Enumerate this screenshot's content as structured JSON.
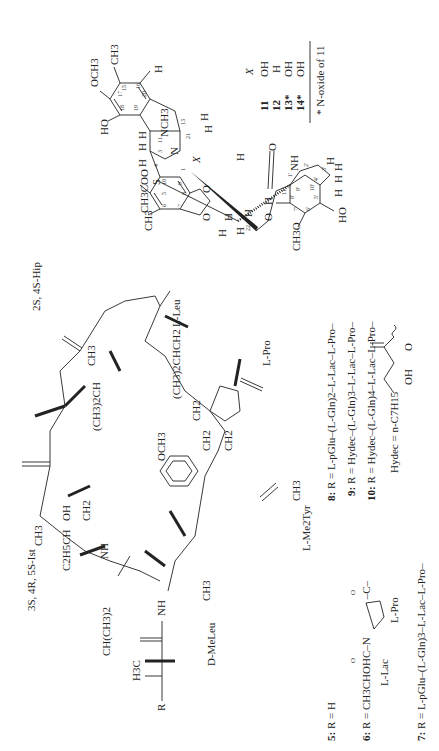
{
  "document": {
    "orientation": "rotated-90-ccw",
    "ecteinascidin": {
      "atoms": {
        "och3_top": "OCH3",
        "ch3_16": "CH3",
        "ho_18": "HO",
        "nch3": "NCH3",
        "s": "S",
        "n2": "N",
        "x_sub": "X",
        "ch3coo": "CH3COO",
        "ch3_6": "CH3",
        "o_a": "O",
        "o_b": "O",
        "o_22": "O",
        "o_carbonyl": "O",
        "nh_2p": "NH",
        "ch3o_7p": "CH3O",
        "ho_6p": "HO",
        "h": "H"
      },
      "ring_numbers": [
        "1",
        "2",
        "3",
        "4",
        "5",
        "6",
        "7",
        "8",
        "9",
        "10",
        "11",
        "12",
        "13",
        "14",
        "15",
        "16",
        "17",
        "18",
        "19",
        "20",
        "21",
        "22"
      ],
      "prime_numbers": [
        "1'",
        "2'",
        "3'",
        "4'",
        "5'",
        "6'",
        "7'",
        "8'",
        "9'",
        "10'",
        "11'",
        "12'"
      ],
      "table": {
        "header": [
          "",
          "X"
        ],
        "rows": [
          {
            "compound": "11",
            "x": "OH"
          },
          {
            "compound": "12",
            "x": "H"
          },
          {
            "compound": "13*",
            "x": "OH"
          },
          {
            "compound": "14*",
            "x": "OH"
          }
        ],
        "footnote": "* N-oxide of 11"
      }
    },
    "didemnin": {
      "residue_labels": {
        "hip": "2S, 4S-Hip",
        "leu": "L-Leu",
        "pro": "L-Pro",
        "ist": "3S, 4R, 5S-Ist",
        "meleu": "D-MeLeu",
        "tyr": "L-Me2Tyr"
      },
      "groups": {
        "ch3_hip": "CH3",
        "ipr_hip": "(CH3)2CH",
        "ibu_leu": "(CH3)2CHCH2",
        "ch2": "CH2",
        "och3_tyr": "OCH3",
        "ch3_n": "CH3",
        "oh_ist": "OH",
        "ch3_ist": "CH3",
        "et_ist": "C2H5CH",
        "nh": "NH",
        "ch3_lac": "CH3",
        "chme2": "CH(CH3)2",
        "h3c": "H3C",
        "r": "R",
        "c": "C",
        "n": "N",
        "o": "O",
        "h": "H"
      },
      "r_definitions": [
        {
          "id": "5:",
          "text": "R = H"
        },
        {
          "id": "6:",
          "text": "R = CH3CHOHC–N",
          "tail": "–C–",
          "sub_labels": [
            "L-Lac",
            "L-Pro"
          ]
        },
        {
          "id": "7:",
          "text": "R = L-pGlu–(L-Gln)3–L-Lac–L-Pro–"
        },
        {
          "id": "8:",
          "text": "R = L-pGlu–(L-Gln)2–L-Lac–L-Pro–"
        },
        {
          "id": "9:",
          "text": "R = Hydec–(L-Gln)3–L-Lac–L-Pro–"
        },
        {
          "id": "10:",
          "text": "R = Hydec–(L-Gln)4–L-Lac–L-Pro–"
        }
      ],
      "hydec_definition": {
        "lhs": "Hydec = n-C7H15",
        "oh": "OH",
        "o": "O"
      }
    }
  }
}
